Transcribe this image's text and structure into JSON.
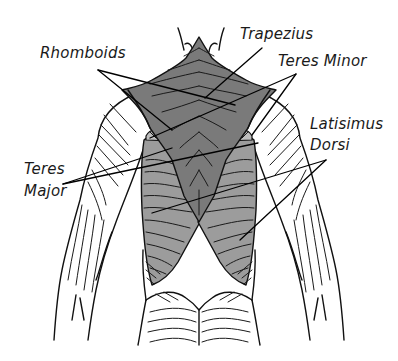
{
  "diagram": {
    "colors": {
      "trapezius": "#7a7a7a",
      "latissimus_dorsi": "#9c9c9c",
      "teres": "#bdbdbd",
      "outline": "#111111",
      "background": "#ffffff"
    },
    "labels": {
      "trapezius": "Trapezius",
      "rhomboids": "Rhomboids",
      "teres_minor": "Teres Minor",
      "latissimus_line1": "Latisimus",
      "latissimus_line2": "Dorsi",
      "teres_major_line1": "Teres",
      "teres_major_line2": "Major"
    }
  }
}
